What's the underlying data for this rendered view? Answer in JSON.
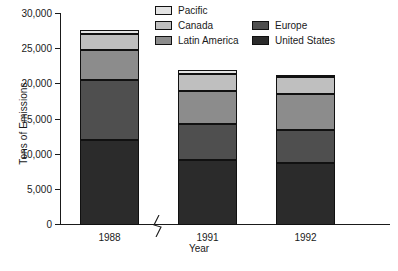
{
  "chart_data": {
    "type": "bar",
    "subtype": "stacked-bar",
    "title": "",
    "xlabel": "Year",
    "ylabel": "Tons of Emissions",
    "categories": [
      "1988",
      "1991",
      "1992"
    ],
    "ylim": [
      0,
      30000
    ],
    "yticks": [
      0,
      5000,
      10000,
      15000,
      20000,
      25000,
      30000
    ],
    "ytick_labels": [
      "0",
      "5,000",
      "10,000",
      "15,000",
      "20,000",
      "25,000",
      "30,000"
    ],
    "grid": false,
    "legend_position": "top-center",
    "axis_break": {
      "present": true,
      "between": [
        "1988",
        "1991"
      ],
      "symbol": "zigzag"
    },
    "series": [
      {
        "name": "United States",
        "color": "#2b2b2b",
        "values": [
          12100,
          9200,
          8800
        ]
      },
      {
        "name": "Europe",
        "color": "#4f4f4f",
        "values": [
          8500,
          5100,
          4700
        ]
      },
      {
        "name": "Latin America",
        "color": "#8c8c8c",
        "values": [
          4300,
          4800,
          5100
        ]
      },
      {
        "name": "Canada",
        "color": "#bfbfbf",
        "values": [
          2200,
          2400,
          2400
        ]
      },
      {
        "name": "Pacific",
        "color": "#e3e3e3",
        "values": [
          600,
          500,
          300
        ]
      }
    ],
    "totals": [
      27700,
      22000,
      21300
    ],
    "stack_order_bottom_to_top": [
      "United States",
      "Europe",
      "Latin America",
      "Canada",
      "Pacific"
    ]
  },
  "legend": {
    "columns": [
      {
        "items": [
          {
            "label": "Pacific",
            "color": "#e3e3e3"
          },
          {
            "label": "Canada",
            "color": "#bfbfbf"
          },
          {
            "label": "Latin America",
            "color": "#8c8c8c"
          }
        ]
      },
      {
        "items": [
          {
            "label": "Europe",
            "color": "#4f4f4f"
          },
          {
            "label": "United States",
            "color": "#2b2b2b"
          }
        ]
      }
    ]
  },
  "axes": {
    "y_title": "Tons of Emissions",
    "x_title": "Year"
  }
}
